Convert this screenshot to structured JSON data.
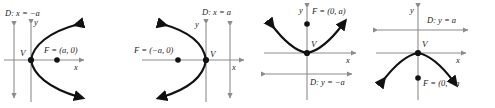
{
  "figure": {
    "type": "parabola-standard-forms",
    "panel_count": 4,
    "colors": {
      "curve": "#111111",
      "axis": "#8c8c8c",
      "directrix": "#8c8c8c",
      "point": "#111111",
      "text": "#222222",
      "background": "#ffffff"
    },
    "panels": [
      {
        "id": "panel-right-opening",
        "opens": "right",
        "vertex_label": "V",
        "focus_label": "F = (a, 0)",
        "directrix_label": "D: x = −a",
        "x_axis_label": "x",
        "y_axis_label": "y",
        "directrix_orientation": "vertical",
        "directrix_side": "left"
      },
      {
        "id": "panel-left-opening",
        "opens": "left",
        "vertex_label": "V",
        "focus_label": "F = (−a, 0)",
        "directrix_label": "D: x = a",
        "x_axis_label": "x",
        "y_axis_label": "y",
        "directrix_orientation": "vertical",
        "directrix_side": "right"
      },
      {
        "id": "panel-up-opening",
        "opens": "up",
        "vertex_label": "V",
        "focus_label": "F = (0, a)",
        "directrix_label": "D: y = −a",
        "x_axis_label": "x",
        "y_axis_label": "y",
        "directrix_orientation": "horizontal",
        "directrix_side": "below"
      },
      {
        "id": "panel-down-opening",
        "opens": "down",
        "vertex_label": "V",
        "focus_label": "F = (0, −a",
        "directrix_label": "D: y = a",
        "x_axis_label": "x",
        "y_axis_label": "y",
        "directrix_orientation": "horizontal",
        "directrix_side": "above"
      }
    ]
  }
}
